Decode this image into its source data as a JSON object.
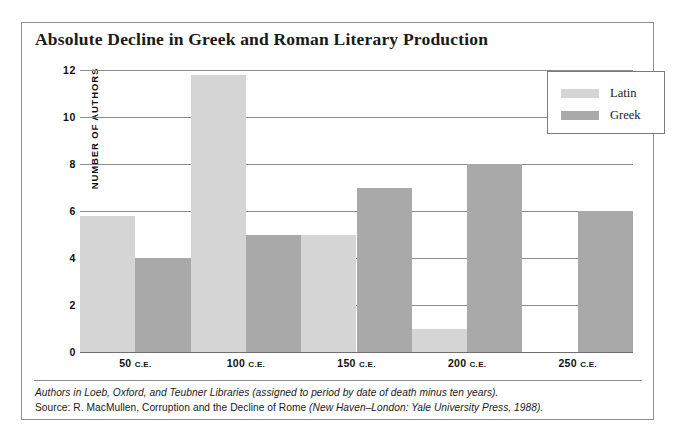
{
  "chart_data": {
    "type": "bar",
    "title": "Absolute Decline in Greek and Roman Literary Production",
    "xlabel": "",
    "ylabel": "NUMBER OF AUTHORS",
    "categories": [
      "50 C.E.",
      "100 C.E.",
      "150 C.E.",
      "200 C.E.",
      "250 C.E."
    ],
    "series": [
      {
        "name": "Latin",
        "color": "#d5d5d5",
        "values": [
          5.8,
          11.8,
          5,
          1,
          0
        ]
      },
      {
        "name": "Greek",
        "color": "#a9a9a9",
        "values": [
          4,
          5,
          7,
          8,
          6
        ]
      }
    ],
    "ylim": [
      0,
      12
    ],
    "yticks": [
      0,
      2,
      4,
      6,
      8,
      10,
      12
    ],
    "ytick_labels": [
      "0",
      "2",
      "4",
      "6",
      "8",
      "10",
      "12"
    ],
    "grid": true,
    "legend_position": "top-right",
    "bar_style": "histogram-contiguous"
  },
  "legend": {
    "items": [
      {
        "label": "Latin",
        "swatch": "latin"
      },
      {
        "label": "Greek",
        "swatch": "greek"
      }
    ]
  },
  "xticks": [
    {
      "number": "50",
      "era": "C.E."
    },
    {
      "number": "100",
      "era": "C.E."
    },
    {
      "number": "150",
      "era": "C.E."
    },
    {
      "number": "200",
      "era": "C.E."
    },
    {
      "number": "250",
      "era": "C.E."
    }
  ],
  "footer": {
    "line1": "Authors in Loeb, Oxford, and Teubner Libraries (assigned to period by date of death minus ten years).",
    "line2_prefix": "Source: R. MacMullen, ",
    "line2_title": "Corruption and the Decline of Rome",
    "line2_suffix": " (New Haven–London: Yale University Press, 1988)."
  }
}
